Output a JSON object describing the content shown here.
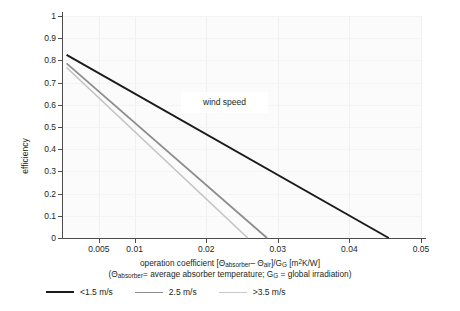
{
  "chart_data": {
    "type": "line",
    "title": "",
    "xlabel": "operation coefficient [Θabsorber − Θair]/GG [m²K/W]",
    "xlabel_sub": "(Θabsorber = average absorber temperature; GG = global irradiation)",
    "ylabel": "efficiency",
    "xlim": [
      0,
      0.05
    ],
    "ylim": [
      0,
      1
    ],
    "grid": true,
    "legend_position": "bottom-left",
    "annotation": "wind speed",
    "x_ticks": [
      "0.005",
      "0.01",
      "0.02",
      "0.03",
      "0.04",
      "0.05"
    ],
    "x_tick_values": [
      0.005,
      0.01,
      0.02,
      0.03,
      0.04,
      0.05
    ],
    "y_ticks": [
      "0",
      "0.1",
      "0.2",
      "0.3",
      "0.4",
      "0.5",
      "0.6",
      "0.7",
      "0.8",
      "0.9",
      "1"
    ],
    "y_tick_values": [
      0,
      0.1,
      0.2,
      0.3,
      0.4,
      0.5,
      0.6,
      0.7,
      0.8,
      0.9,
      1
    ],
    "series": [
      {
        "name": "<1.5 m/s",
        "color": "#1a1a1a",
        "width": 1.9,
        "x": [
          0.0005,
          0.0455
        ],
        "values": [
          0.825,
          0.0
        ]
      },
      {
        "name": "2.5 m/s",
        "color": "#8c8c8c",
        "width": 1.7,
        "x": [
          0.0005,
          0.0285
        ],
        "values": [
          0.787,
          0.0
        ]
      },
      {
        "name": ">3.5 m/s",
        "color": "#c4c4c4",
        "width": 1.7,
        "x": [
          0.0005,
          0.0258
        ],
        "values": [
          0.768,
          0.0
        ]
      }
    ]
  },
  "legend": {
    "items": [
      {
        "label": "<1.5 m/s",
        "color": "#1a1a1a",
        "thickness": "2.2px"
      },
      {
        "label": "2.5 m/s",
        "color": "#8c8c8c",
        "thickness": "1.5px"
      },
      {
        "label": ">3.5 m/s",
        "color": "#c9c9c9",
        "thickness": "1.5px"
      }
    ]
  },
  "annotation": {
    "wind_speed_label": "wind speed"
  },
  "axis": {
    "y_title": "efficiency"
  },
  "colors": {
    "axis": "#4d4d4d",
    "plot_bg": "#fbfbfb",
    "grid": "#f0f0f0",
    "text": "#231f20"
  }
}
